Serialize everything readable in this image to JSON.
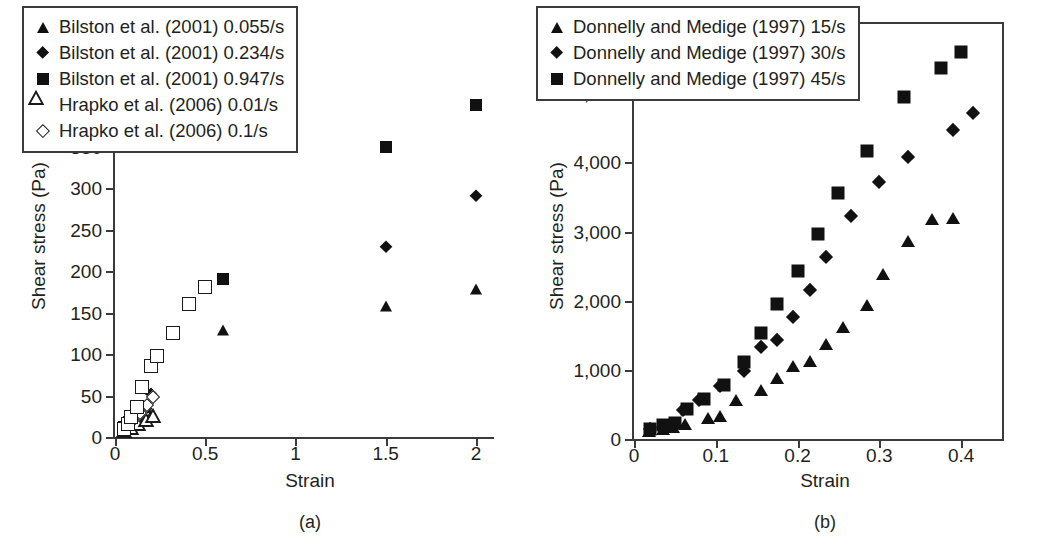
{
  "figure": {
    "panels": [
      {
        "caption": "(a)",
        "xlabel": "Strain",
        "ylabel": "Shear stress (Pa)",
        "xticks": [
          "0",
          "0.5",
          "1",
          "1.5",
          "2"
        ],
        "yticks": [
          "0",
          "50",
          "100",
          "150",
          "200",
          "250",
          "300",
          "350",
          "400",
          "450",
          "500"
        ],
        "legend": [
          {
            "marker": "triangle-filled",
            "label": "Bilston et al. (2001) 0.055/s"
          },
          {
            "marker": "diamond-filled",
            "label": "Bilston et al. (2001) 0.234/s"
          },
          {
            "marker": "square-filled",
            "label": "Bilston et al. (2001) 0.947/s"
          },
          {
            "marker": "triangle-open",
            "label": "Hrapko et al. (2006) 0.01/s"
          },
          {
            "marker": "diamond-open",
            "label": "Hrapko et al. (2006) 0.1/s"
          }
        ]
      },
      {
        "caption": "(b)",
        "xlabel": "Strain",
        "ylabel": "Shear stress (Pa)",
        "xticks": [
          "0",
          "0.1",
          "0.2",
          "0.3",
          "0.4"
        ],
        "yticks": [
          "0",
          "1,000",
          "2,000",
          "3,000",
          "4,000",
          "5,000",
          "6,000"
        ],
        "legend": [
          {
            "marker": "triangle-filled",
            "label": "Donnelly and Medige (1997) 15/s"
          },
          {
            "marker": "diamond-filled",
            "label": "Donnelly and Medige (1997) 30/s"
          },
          {
            "marker": "square-filled",
            "label": "Donnelly and Medige (1997) 45/s"
          }
        ]
      }
    ]
  },
  "chart_data": [
    {
      "type": "scatter",
      "title": "(a)",
      "xlabel": "Strain",
      "ylabel": "Shear stress (Pa)",
      "xlim": [
        0,
        2.1
      ],
      "ylim": [
        0,
        500
      ],
      "xticks": [
        0,
        0.5,
        1,
        1.5,
        2
      ],
      "yticks": [
        0,
        50,
        100,
        150,
        200,
        250,
        300,
        350,
        400,
        450,
        500
      ],
      "grid": false,
      "legend_position": "upper-left",
      "series": [
        {
          "name": "Bilston et al. (2001) 0.055/s",
          "marker": "triangle-filled",
          "points": [
            [
              0.04,
              6
            ],
            [
              0.07,
              10
            ],
            [
              0.1,
              14
            ],
            [
              0.13,
              18
            ],
            [
              0.16,
              22
            ],
            [
              0.2,
              27
            ],
            [
              0.6,
              129
            ],
            [
              1.5,
              158
            ],
            [
              2.0,
              178
            ]
          ]
        },
        {
          "name": "Bilston et al. (2001) 0.234/s",
          "marker": "diamond-filled",
          "points": [
            [
              0.05,
              9
            ],
            [
              0.08,
              14
            ],
            [
              0.11,
              20
            ],
            [
              0.14,
              26
            ],
            [
              0.17,
              34
            ],
            [
              0.2,
              52
            ],
            [
              1.5,
              229
            ],
            [
              2.0,
              290
            ]
          ]
        },
        {
          "name": "Bilston et al. (2001) 0.947/s",
          "marker": "square-filled",
          "points": [
            [
              0.05,
              12
            ],
            [
              0.08,
              18
            ],
            [
              0.12,
              26
            ],
            [
              0.16,
              36
            ],
            [
              0.6,
              190
            ],
            [
              1.5,
              350
            ],
            [
              2.0,
              400
            ]
          ]
        },
        {
          "name": "Hrapko et al. (2006) 0.01/s",
          "marker": "triangle-open",
          "points": [
            [
              0.05,
              7
            ],
            [
              0.09,
              11
            ],
            [
              0.13,
              16
            ],
            [
              0.17,
              21
            ],
            [
              0.21,
              25
            ]
          ]
        },
        {
          "name": "Hrapko et al. (2006) 0.1/s",
          "marker": "diamond-open",
          "points": [
            [
              0.06,
              12
            ],
            [
              0.1,
              20
            ],
            [
              0.14,
              29
            ],
            [
              0.18,
              38
            ],
            [
              0.21,
              48
            ]
          ]
        },
        {
          "name": "unlabeled open square series",
          "marker": "square-open",
          "points": [
            [
              0.05,
              10
            ],
            [
              0.07,
              16
            ],
            [
              0.09,
              24
            ],
            [
              0.12,
              36
            ],
            [
              0.15,
              60
            ],
            [
              0.2,
              85
            ],
            [
              0.23,
              97
            ],
            [
              0.32,
              125
            ],
            [
              0.41,
              160
            ],
            [
              0.5,
              181
            ]
          ]
        }
      ]
    },
    {
      "type": "scatter",
      "title": "(b)",
      "xlabel": "Strain",
      "ylabel": "Shear stress (Pa)",
      "xlim": [
        0,
        0.45
      ],
      "ylim": [
        0,
        6000
      ],
      "xticks": [
        0,
        0.1,
        0.2,
        0.3,
        0.4
      ],
      "yticks": [
        0,
        1000,
        2000,
        3000,
        4000,
        5000,
        6000
      ],
      "grid": false,
      "legend_position": "upper-left",
      "series": [
        {
          "name": "Donnelly and Medige (1997) 15/s",
          "marker": "triangle-filled",
          "points": [
            [
              0.018,
              120
            ],
            [
              0.035,
              140
            ],
            [
              0.048,
              170
            ],
            [
              0.062,
              210
            ],
            [
              0.09,
              300
            ],
            [
              0.105,
              330
            ],
            [
              0.125,
              560
            ],
            [
              0.155,
              710
            ],
            [
              0.175,
              880
            ],
            [
              0.195,
              1060
            ],
            [
              0.215,
              1130
            ],
            [
              0.235,
              1380
            ],
            [
              0.255,
              1620
            ],
            [
              0.285,
              1940
            ],
            [
              0.305,
              2390
            ],
            [
              0.335,
              2860
            ],
            [
              0.365,
              3180
            ],
            [
              0.39,
              3190
            ]
          ]
        },
        {
          "name": "Donnelly and Medige (1997) 30/s",
          "marker": "diamond-filled",
          "points": [
            [
              0.02,
              140
            ],
            [
              0.035,
              180
            ],
            [
              0.045,
              200
            ],
            [
              0.06,
              420
            ],
            [
              0.08,
              560
            ],
            [
              0.105,
              760
            ],
            [
              0.135,
              990
            ],
            [
              0.155,
              1330
            ],
            [
              0.175,
              1430
            ],
            [
              0.195,
              1760
            ],
            [
              0.215,
              2150
            ],
            [
              0.235,
              2630
            ],
            [
              0.265,
              3220
            ],
            [
              0.3,
              3710
            ],
            [
              0.335,
              4080
            ],
            [
              0.39,
              4470
            ],
            [
              0.415,
              4720
            ]
          ]
        },
        {
          "name": "Donnelly and Medige (1997) 45/s",
          "marker": "square-filled",
          "points": [
            [
              0.02,
              150
            ],
            [
              0.035,
              200
            ],
            [
              0.05,
              230
            ],
            [
              0.065,
              430
            ],
            [
              0.085,
              580
            ],
            [
              0.11,
              780
            ],
            [
              0.135,
              1120
            ],
            [
              0.155,
              1530
            ],
            [
              0.175,
              1950
            ],
            [
              0.2,
              2430
            ],
            [
              0.225,
              2960
            ],
            [
              0.25,
              3560
            ],
            [
              0.285,
              4170
            ],
            [
              0.33,
              4950
            ],
            [
              0.375,
              5370
            ],
            [
              0.4,
              5590
            ]
          ]
        }
      ]
    }
  ]
}
